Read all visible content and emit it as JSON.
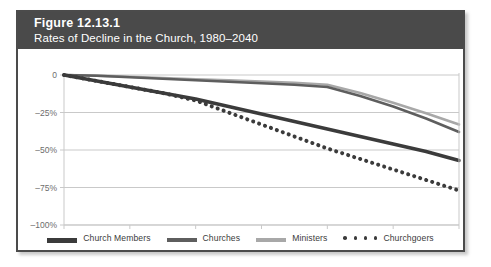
{
  "figure": {
    "label_word": "Figure",
    "number": "12.13.1",
    "subtitle": "Rates of Decline in the Church, 1980–2040"
  },
  "colors": {
    "header_band": "#4a4a4a",
    "card_border": "#4b4b4b",
    "grid": "#c9c9c9",
    "axis_text": "#6d6d6d",
    "church_members": "#3b3b3b",
    "churches": "#5e5e5e",
    "ministers": "#a8a8a8",
    "churchgoers": "#3b3b3b"
  },
  "legend": {
    "position": "bottom",
    "items": [
      {
        "label": "Church Members",
        "marker": "thick-solid-line",
        "color": "#3b3b3b"
      },
      {
        "label": "Churches",
        "marker": "solid-line",
        "color": "#5e5e5e"
      },
      {
        "label": "Ministers",
        "marker": "solid-line",
        "color": "#a8a8a8"
      },
      {
        "label": "Churchgoers",
        "marker": "dotted-line",
        "color": "#3b3b3b"
      }
    ]
  },
  "chart_data": {
    "type": "line",
    "title": "Rates of Decline in the Church, 1980–2040",
    "xlabel": "",
    "ylabel": "",
    "xlim": [
      1980,
      2040
    ],
    "ylim": [
      -100,
      0
    ],
    "grid": true,
    "xticks": [
      1980,
      1990,
      2000,
      2010,
      2020,
      2030,
      2040
    ],
    "xtick_labels": [
      "1980",
      "1990",
      "2000",
      "2010",
      "2020",
      "2030",
      "2040"
    ],
    "yticks": [
      0,
      -25,
      -50,
      -75,
      -100
    ],
    "ytick_labels": [
      "0",
      "–25%",
      "–50%",
      "–75%",
      "–100%"
    ],
    "x": [
      1980,
      1985,
      1990,
      1995,
      2000,
      2005,
      2010,
      2015,
      2020,
      2025,
      2030,
      2035,
      2040
    ],
    "series": [
      {
        "name": "Church Members",
        "color": "#3b3b3b",
        "style": "thick-solid",
        "values": [
          0,
          -4,
          -8,
          -12,
          -16,
          -21,
          -26,
          -31,
          -36,
          -41,
          -46,
          -51,
          -57
        ]
      },
      {
        "name": "Churches",
        "color": "#5e5e5e",
        "style": "solid",
        "values": [
          0,
          -0.5,
          -1.5,
          -2.5,
          -3.5,
          -4.5,
          -5.5,
          -6.5,
          -8,
          -14,
          -21,
          -29,
          -38
        ]
      },
      {
        "name": "Ministers",
        "color": "#a8a8a8",
        "style": "solid",
        "values": [
          0,
          -0.4,
          -1.2,
          -2,
          -2.8,
          -3.6,
          -4.4,
          -5.2,
          -6.5,
          -12,
          -18.5,
          -25.5,
          -33
        ]
      },
      {
        "name": "Churchgoers",
        "color": "#3b3b3b",
        "style": "dotted",
        "values": [
          0,
          -4,
          -8,
          -12,
          -17,
          -25,
          -33,
          -41,
          -49,
          -56,
          -63,
          -70,
          -77
        ]
      }
    ]
  }
}
